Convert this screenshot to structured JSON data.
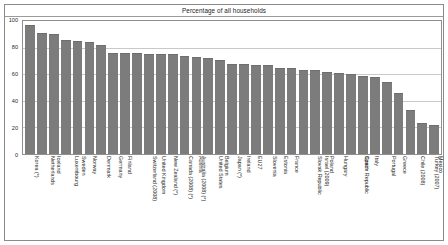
{
  "chart_data": {
    "type": "bar",
    "title": "Percentage of all households",
    "xlabel": "",
    "ylabel": "",
    "ylim": [
      0,
      100
    ],
    "yticks": [
      0,
      20,
      40,
      60,
      80,
      100
    ],
    "grid": true,
    "legend": false,
    "bar_color": "#7c7c7c",
    "categories": [
      "Korea (*)",
      "Netherlands",
      "Iceland",
      "Luxembourg",
      "Sweden",
      "Norway",
      "Denmark",
      "Germany",
      "Finland",
      "Switzerland (2008)",
      "United Kingdom",
      "New Zealand (*)",
      "Canada (2008) (*)",
      "Australia (2008) (*)",
      "Austria",
      "United States",
      "Belgium",
      "Japan (*)",
      "Ireland",
      "EU27",
      "Slovenia",
      "Estonia",
      "France",
      "Slovak Republic",
      "Israel (2009)",
      "Poland",
      "Hungary",
      "Czech Republic",
      "Spain",
      "Italy",
      "Portugal",
      "Greece",
      "Chile (2008)",
      "Turkey (2007)",
      "Mexico"
    ],
    "values": [
      97,
      91,
      90,
      86,
      85,
      84,
      82,
      76,
      76,
      76,
      75,
      75,
      75,
      74,
      73,
      72,
      71,
      68,
      68,
      67,
      67,
      65,
      65,
      63,
      63,
      62,
      61,
      60,
      59,
      58,
      54,
      46,
      33,
      23,
      22
    ]
  }
}
